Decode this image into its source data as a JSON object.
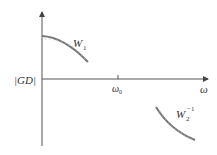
{
  "diagram": {
    "type": "loop-shaping bound sketch",
    "axes": {
      "x_label": "ω",
      "y_label": "|GD|",
      "x_tick": {
        "label": "ω",
        "subscript": "0"
      }
    },
    "curves": [
      {
        "name": "W1",
        "label": "W",
        "subscript": "1",
        "superscript": "",
        "hatch_side": "below"
      },
      {
        "name": "W2_inverse",
        "label": "W",
        "subscript": "2",
        "superscript": "−1",
        "hatch_side": "below"
      }
    ],
    "colors": {
      "axis": "#555555",
      "curve": "#777777",
      "text": "#333333",
      "background": "#ffffff"
    }
  }
}
